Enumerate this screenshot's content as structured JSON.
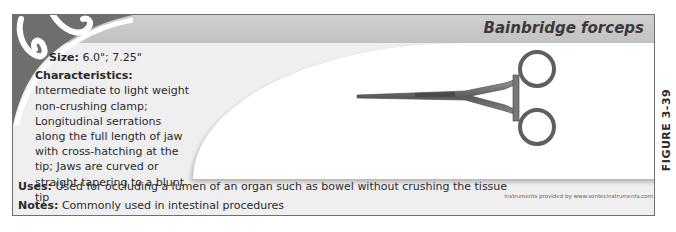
{
  "header": {
    "title": "Bainbridge forceps",
    "clipped_top_text": "INSTRUMENT GUIDE"
  },
  "specs": {
    "size_label": "Size:",
    "size_value": "6.0\"; 7.25\"",
    "characteristics_label": "Characteristics:",
    "characteristics_value": "Intermediate to light weight non-crushing clamp; Longitudinal serrations along the full length of jaw with cross-hatching at the tip; Jaws are curved or straight tapering to a blunt tip"
  },
  "uses": {
    "label": "Uses:",
    "value": "Used for occluding a lumen of an organ such as bowel without crushing the tissue"
  },
  "notes": {
    "label": "Notes:",
    "value": "Commonly used in intestinal procedures"
  },
  "image": {
    "subject": "forceps-illustration",
    "credit": "Instruments provided by www.sontecinstruments.com"
  },
  "figure": {
    "label": "FIGURE 3-39"
  },
  "colors": {
    "border": "#6f6f6f",
    "header_band": "#c6c6c6",
    "body_bg": "#efefef",
    "photo_bg": "#ffffff",
    "text": "#2a2a2a",
    "corner_ornament": "#6e6e6e"
  }
}
